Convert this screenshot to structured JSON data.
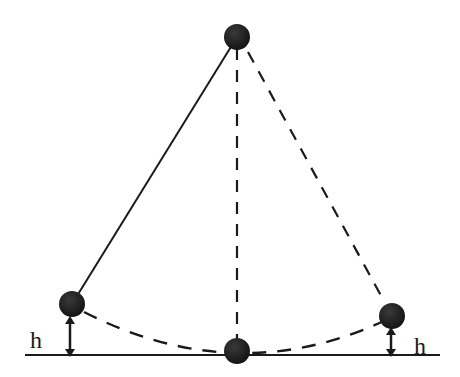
{
  "diagram": {
    "colors": {
      "background": "#ffffff",
      "stroke": "#1a1a1a",
      "bob": "#1c1c1c"
    },
    "labels": {
      "left_height": "h",
      "right_height": "h"
    },
    "elements": {
      "pivot_bob": "pivot-bob",
      "string_solid": "pendulum-string",
      "string_vertical_dashed": "equilibrium-string",
      "string_right_dashed": "right-extreme-string",
      "arc_dashed": "swing-arc",
      "ground_line": "reference-line",
      "left_bob": "left-extreme-bob",
      "bottom_bob": "lowest-point-bob",
      "right_bob": "right-extreme-bob"
    }
  }
}
